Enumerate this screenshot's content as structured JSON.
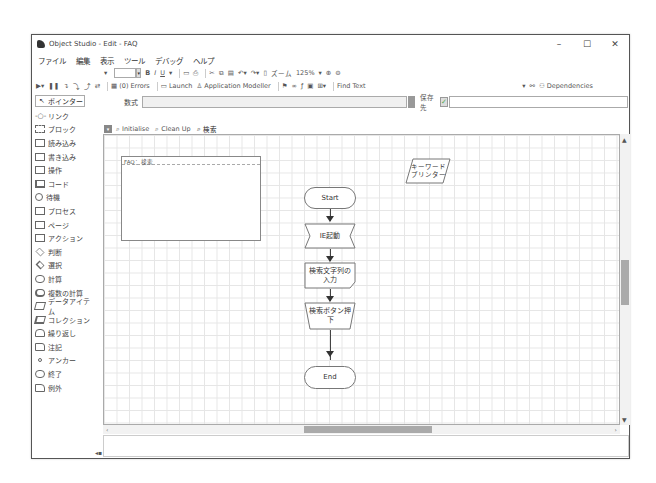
{
  "window": {
    "title": "Object Studio - Edit - FAQ",
    "controls": {
      "minimize": "–",
      "maximize": "☐",
      "close": "✕"
    }
  },
  "menu": [
    "ファイル",
    "編集",
    "表示",
    "ツール",
    "デバッグ",
    "ヘルプ"
  ],
  "toolbar1": {
    "bold": "B",
    "italic": "I",
    "underline": "U",
    "zoom_label": "ズーム",
    "zoom_value": "125%"
  },
  "toolbar2": {
    "errors": "(0) Errors",
    "launch": "Launch",
    "app_modeller": "Application Modeller",
    "find_text": "Find Text",
    "dependencies": "Dependencies"
  },
  "expression_bar": {
    "label": "数式",
    "value": "",
    "store_label": "保存先",
    "store_value": ""
  },
  "sidebar": {
    "pointer": "ポインター",
    "items": [
      {
        "label": "リンク",
        "shape": "link"
      },
      {
        "label": "ブロック",
        "shape": "block"
      },
      {
        "label": "読み込み",
        "shape": "rect"
      },
      {
        "label": "書き込み",
        "shape": "rect"
      },
      {
        "label": "操作",
        "shape": "rect"
      },
      {
        "label": "コード",
        "shape": "thick"
      },
      {
        "label": "待機",
        "shape": "circle"
      },
      {
        "label": "プロセス",
        "shape": "rect"
      },
      {
        "label": "ページ",
        "shape": "rect"
      },
      {
        "label": "アクション",
        "shape": "rect"
      },
      {
        "label": "判断",
        "shape": "diamond"
      },
      {
        "label": "選択",
        "shape": "diamond"
      },
      {
        "label": "計算",
        "shape": "round"
      },
      {
        "label": "複数の計算",
        "shape": "round"
      },
      {
        "label": "データアイテム",
        "shape": "para"
      },
      {
        "label": "コレクション",
        "shape": "para"
      },
      {
        "label": "繰り返し",
        "shape": "round"
      },
      {
        "label": "注記",
        "shape": "rect"
      },
      {
        "label": "アンカー",
        "shape": "dot"
      },
      {
        "label": "終了",
        "shape": "round"
      },
      {
        "label": "例外",
        "shape": "rect"
      }
    ]
  },
  "tabs": [
    {
      "label": "Initialise",
      "active": false
    },
    {
      "label": "Clean Up",
      "active": false
    },
    {
      "label": "検索",
      "active": true
    }
  ],
  "canvas": {
    "page_box_title": "FAQ：検索",
    "data_item": "キーワード\nプリンター",
    "nodes": {
      "start": "Start",
      "ie": "IE起動",
      "input": "検索文字列の\n入力",
      "press": "検索ボタン押\n下",
      "end": "End"
    }
  }
}
